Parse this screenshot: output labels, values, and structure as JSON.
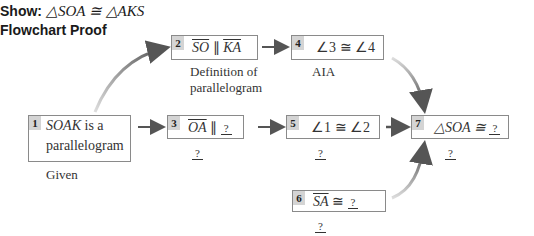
{
  "header": {
    "show_label": "Show:",
    "show_statement": "△SOA ≅ △AKS",
    "title": "Flowchart Proof"
  },
  "steps": [
    {
      "num": "1",
      "statement_italic": "SOAK",
      "statement_rest": " is a",
      "statement_line2": "parallelogram",
      "reason": "Given"
    },
    {
      "num": "2",
      "seg1": "SO",
      "rel": " ∥ ",
      "seg2": "KA",
      "reason_line1": "Definition of",
      "reason_line2": "parallelogram"
    },
    {
      "num": "3",
      "seg1": "OA",
      "rel": " ∥ ",
      "blank": "?",
      "reason": "?"
    },
    {
      "num": "4",
      "statement": "∠3 ≅ ∠4",
      "reason": "AIA"
    },
    {
      "num": "5",
      "statement": "∠1 ≅ ∠2",
      "reason": "?"
    },
    {
      "num": "6",
      "seg1": "SA",
      "rel": " ≅ ",
      "blank": "?",
      "reason": "?"
    },
    {
      "num": "7",
      "statement": "△SOA ≅ ",
      "blank": "?",
      "reason": "?"
    }
  ],
  "colors": {
    "box_border": "#8a8a8a",
    "number_badge": "#d4d4d4",
    "arrow": "#555555"
  }
}
